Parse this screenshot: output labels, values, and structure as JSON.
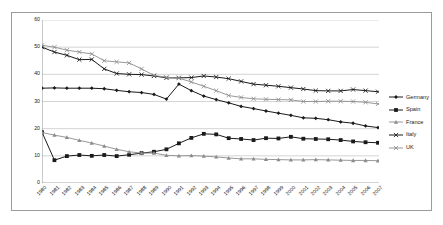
{
  "chart_data": {
    "type": "line",
    "title": "",
    "xlabel": "",
    "ylabel": "",
    "ylim": [
      0,
      60
    ],
    "yticks": [
      0,
      10,
      20,
      30,
      40,
      50,
      60
    ],
    "grid": true,
    "legend_position": "right",
    "categories": [
      "1980",
      "1981",
      "1982",
      "1983",
      "1984",
      "1985",
      "1986",
      "1987",
      "1988",
      "1989",
      "1990",
      "1991",
      "1992",
      "1993",
      "1994",
      "1995",
      "1996",
      "1997",
      "1998",
      "1999",
      "2000",
      "2001",
      "2002",
      "2003",
      "2004",
      "2005",
      "2006",
      "2007"
    ],
    "series": [
      {
        "name": "Germany",
        "color": "#1a1a1a",
        "marker": "diamond",
        "values": [
          34.9,
          35.0,
          34.9,
          34.9,
          34.9,
          34.7,
          34.1,
          33.6,
          33.3,
          32.6,
          30.9,
          36.4,
          34.0,
          32.0,
          30.7,
          29.5,
          28.2,
          27.4,
          26.5,
          25.7,
          24.9,
          24.0,
          23.8,
          23.3,
          22.5,
          22.0,
          21.0,
          20.4
        ]
      },
      {
        "name": "Spain",
        "color": "#1a1a1a",
        "marker": "square",
        "values": [
          18.7,
          8.4,
          9.9,
          10.3,
          10.0,
          10.3,
          9.9,
          10.4,
          11.0,
          11.5,
          12.4,
          14.6,
          16.6,
          18.1,
          17.9,
          16.5,
          16.2,
          15.8,
          16.5,
          16.4,
          17.0,
          16.3,
          16.2,
          16.1,
          15.8,
          15.3,
          15.0,
          14.8
        ]
      },
      {
        "name": "France",
        "color": "#8c8c8c",
        "marker": "triangle",
        "values": [
          18.6,
          17.6,
          16.8,
          15.7,
          14.7,
          13.6,
          12.4,
          11.5,
          11.0,
          11.0,
          10.2,
          10.0,
          10.1,
          9.9,
          9.6,
          9.2,
          8.9,
          8.9,
          8.7,
          8.6,
          8.5,
          8.5,
          8.6,
          8.5,
          8.4,
          8.3,
          8.3,
          8.2
        ]
      },
      {
        "name": "Italy",
        "color": "#1a1a1a",
        "marker": "cross",
        "values": [
          50.0,
          48.2,
          47.0,
          45.4,
          45.5,
          42.0,
          40.3,
          40.0,
          39.9,
          39.4,
          38.7,
          38.7,
          38.8,
          39.4,
          39.0,
          38.4,
          37.4,
          36.4,
          36.0,
          35.6,
          35.1,
          34.6,
          34.0,
          33.9,
          33.9,
          34.4,
          34.0,
          33.6
        ]
      },
      {
        "name": "UK",
        "color": "#8c8c8c",
        "marker": "cross",
        "values": [
          50.7,
          50.0,
          48.9,
          48.2,
          47.5,
          45.0,
          44.6,
          44.2,
          42.0,
          39.6,
          38.9,
          38.6,
          37.2,
          35.6,
          34.0,
          32.2,
          31.5,
          31.0,
          30.8,
          30.7,
          30.6,
          30.0,
          30.0,
          30.1,
          30.1,
          30.0,
          29.7,
          29.1
        ]
      }
    ]
  }
}
